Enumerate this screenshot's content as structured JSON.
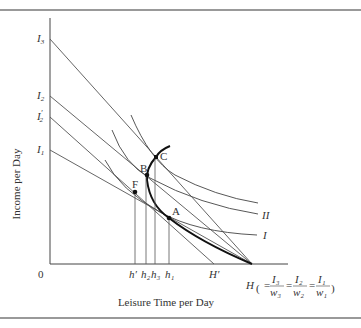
{
  "figure": {
    "ylabel": "Income per Day",
    "xlabel": "Leisure Time per Day",
    "origin": "0",
    "y_ticks": [
      {
        "label": "I",
        "sub": "3",
        "prime": "",
        "y": 39
      },
      {
        "label": "I",
        "sub": "2",
        "prime": "",
        "y": 96
      },
      {
        "label": "I",
        "sub": "2",
        "prime": "′",
        "y": 117
      },
      {
        "label": "I",
        "sub": "1",
        "prime": "",
        "y": 150
      }
    ],
    "x_ticks": [
      {
        "label": "h′",
        "x": 135
      },
      {
        "label": "h₂",
        "x": 146
      },
      {
        "label": "h₃",
        "x": 155
      },
      {
        "label": "h₁",
        "x": 169
      },
      {
        "label": "H′",
        "x": 214
      }
    ],
    "h_label": "H",
    "h_formula": [
      "I₃",
      "w₃",
      "I₂",
      "w₂",
      "I₁",
      "w₁"
    ],
    "points": [
      {
        "name": "A",
        "x": 169,
        "y": 218
      },
      {
        "name": "B",
        "x": 147,
        "y": 175
      },
      {
        "name": "C",
        "x": 156,
        "y": 157
      },
      {
        "name": "F",
        "x": 135,
        "y": 192
      }
    ],
    "curve_labels": {
      "II": "II",
      "I": "I"
    },
    "rule_color": "#666666",
    "line_color": "#444444"
  }
}
